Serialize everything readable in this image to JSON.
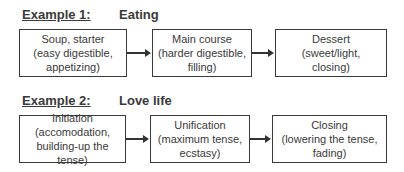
{
  "examples": [
    {
      "label": "Example 1:",
      "topic": "Eating",
      "steps": [
        {
          "lines": [
            "Soup, starter",
            "(easy digestible,",
            "appetizing)"
          ]
        },
        {
          "lines": [
            "Main course",
            "(harder digestible,",
            "filling)"
          ]
        },
        {
          "lines": [
            "Dessert",
            "(sweet/light,",
            "closing)"
          ]
        }
      ]
    },
    {
      "label": "Example 2:",
      "topic": "Love life",
      "steps": [
        {
          "lines": [
            "Initiation",
            "(accomodation,",
            "building-up the tense)"
          ]
        },
        {
          "lines": [
            "Unification",
            "(maximum tense,",
            "ecstasy)"
          ]
        },
        {
          "lines": [
            "Closing",
            "(lowering the tense,",
            "fading)"
          ]
        }
      ]
    }
  ]
}
